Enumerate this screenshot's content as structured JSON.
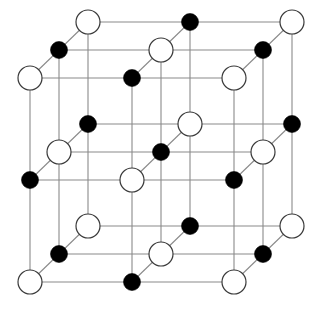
{
  "figure": {
    "caption": "",
    "projection": "oblique",
    "width": 325,
    "height": 310,
    "background_color": "#ffffff"
  },
  "legend": {
    "white_atom_label": "anion (large open sphere)",
    "black_atom_label": "cation (small filled sphere)"
  },
  "style": {
    "bond_color": "#8a8a8a",
    "bond_width": 1.1,
    "white_fill": "#ffffff",
    "white_stroke": "#3a3a3a",
    "black_fill": "#000000",
    "white_radius": 12,
    "black_radius": 8.5
  },
  "chart_data": {
    "type": "scatter",
    "xlabel": "",
    "ylabel": "",
    "grid": true,
    "legend_position": "none",
    "lattice": {
      "dimensions": [
        3,
        3,
        3
      ],
      "origin_px": [
        30,
        22
      ],
      "step_x_px": 102,
      "step_y_px": 102,
      "depth_dx_px": -29,
      "depth_dy_px": 28,
      "depth_levels": 3,
      "parity_rule": "white when (i+j+k) is even, black when odd"
    },
    "atoms": [
      {
        "i": 0,
        "j": 0,
        "k": 2,
        "x": 88,
        "y": 22,
        "type": "white",
        "r": 12
      },
      {
        "i": 1,
        "j": 0,
        "k": 2,
        "x": 190,
        "y": 22,
        "type": "black",
        "r": 8.5
      },
      {
        "i": 2,
        "j": 0,
        "k": 2,
        "x": 292,
        "y": 22,
        "type": "white",
        "r": 12
      },
      {
        "i": 0,
        "j": 0,
        "k": 1,
        "x": 59,
        "y": 50,
        "type": "black",
        "r": 8.5
      },
      {
        "i": 1,
        "j": 0,
        "k": 1,
        "x": 161,
        "y": 50,
        "type": "white",
        "r": 12
      },
      {
        "i": 2,
        "j": 0,
        "k": 1,
        "x": 263,
        "y": 50,
        "type": "black",
        "r": 8.5
      },
      {
        "i": 0,
        "j": 0,
        "k": 0,
        "x": 30,
        "y": 78,
        "type": "white",
        "r": 12
      },
      {
        "i": 1,
        "j": 0,
        "k": 0,
        "x": 132,
        "y": 78,
        "type": "black",
        "r": 8.5
      },
      {
        "i": 2,
        "j": 0,
        "k": 0,
        "x": 234,
        "y": 78,
        "type": "white",
        "r": 12
      },
      {
        "i": 0,
        "j": 1,
        "k": 2,
        "x": 88,
        "y": 124,
        "type": "black",
        "r": 8.5
      },
      {
        "i": 1,
        "j": 1,
        "k": 2,
        "x": 190,
        "y": 124,
        "type": "white",
        "r": 12
      },
      {
        "i": 2,
        "j": 1,
        "k": 2,
        "x": 292,
        "y": 124,
        "type": "black",
        "r": 8.5
      },
      {
        "i": 0,
        "j": 1,
        "k": 1,
        "x": 59,
        "y": 152,
        "type": "white",
        "r": 12
      },
      {
        "i": 1,
        "j": 1,
        "k": 1,
        "x": 161,
        "y": 152,
        "type": "black",
        "r": 8.5
      },
      {
        "i": 2,
        "j": 1,
        "k": 1,
        "x": 263,
        "y": 152,
        "type": "white",
        "r": 12
      },
      {
        "i": 0,
        "j": 1,
        "k": 0,
        "x": 30,
        "y": 180,
        "type": "black",
        "r": 8.5
      },
      {
        "i": 1,
        "j": 1,
        "k": 0,
        "x": 132,
        "y": 180,
        "type": "white",
        "r": 12
      },
      {
        "i": 2,
        "j": 1,
        "k": 0,
        "x": 234,
        "y": 180,
        "type": "black",
        "r": 8.5
      },
      {
        "i": 0,
        "j": 2,
        "k": 2,
        "x": 88,
        "y": 226,
        "type": "white",
        "r": 12
      },
      {
        "i": 1,
        "j": 2,
        "k": 2,
        "x": 190,
        "y": 226,
        "type": "black",
        "r": 8.5
      },
      {
        "i": 2,
        "j": 2,
        "k": 2,
        "x": 292,
        "y": 226,
        "type": "white",
        "r": 12
      },
      {
        "i": 0,
        "j": 2,
        "k": 1,
        "x": 59,
        "y": 254,
        "type": "black",
        "r": 8.5
      },
      {
        "i": 1,
        "j": 2,
        "k": 1,
        "x": 161,
        "y": 254,
        "type": "white",
        "r": 12
      },
      {
        "i": 2,
        "j": 2,
        "k": 1,
        "x": 263,
        "y": 254,
        "type": "black",
        "r": 8.5
      },
      {
        "i": 0,
        "j": 2,
        "k": 0,
        "x": 30,
        "y": 282,
        "type": "white",
        "r": 12
      },
      {
        "i": 1,
        "j": 2,
        "k": 0,
        "x": 132,
        "y": 282,
        "type": "black",
        "r": 8.5
      },
      {
        "i": 2,
        "j": 2,
        "k": 0,
        "x": 234,
        "y": 282,
        "type": "white",
        "r": 12
      }
    ],
    "bond_count": 54,
    "atom_count": 27,
    "white_count": 14,
    "black_count": 13
  }
}
